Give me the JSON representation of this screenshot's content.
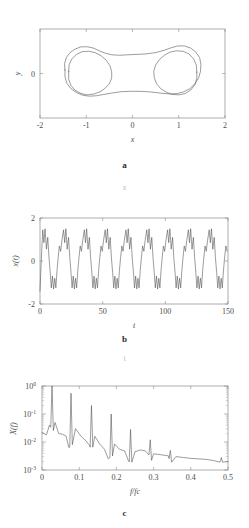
{
  "figure": {
    "caption_a": "a",
    "caption_b": "b",
    "caption_c": "c",
    "ghost_x": "x",
    "ghost_t": "t",
    "curve_color": "#4a4a4a",
    "axis_color": "#8a8a8a"
  },
  "chart_data": [
    {
      "type": "line",
      "panel": "a",
      "title": "",
      "xlabel": "x",
      "ylabel": "y",
      "xlim": [
        -2,
        2
      ],
      "ylim": [
        -1.0,
        1.0
      ],
      "xticks": [
        -2,
        -1,
        0,
        1,
        2
      ],
      "xticklabels": [
        "-2",
        "-1",
        "0",
        "1",
        "2"
      ],
      "yticks": [
        0
      ],
      "yticklabels": [
        "0"
      ],
      "grid": false,
      "legend": "none",
      "description": "Phase portrait: double-well dumbbell shaped attractor with two nested closed orbits",
      "series": [
        {
          "name": "orbit-outer",
          "points": [
            [
              -1.46,
              0.08
            ],
            [
              -1.47,
              0.22
            ],
            [
              -1.43,
              0.36
            ],
            [
              -1.35,
              0.47
            ],
            [
              -1.24,
              0.55
            ],
            [
              -1.11,
              0.6
            ],
            [
              -0.97,
              0.6
            ],
            [
              -0.84,
              0.57
            ],
            [
              -0.72,
              0.51
            ],
            [
              -0.6,
              0.46
            ],
            [
              -0.45,
              0.42
            ],
            [
              -0.28,
              0.41
            ],
            [
              -0.1,
              0.42
            ],
            [
              0.1,
              0.43
            ],
            [
              0.3,
              0.44
            ],
            [
              0.5,
              0.47
            ],
            [
              0.68,
              0.52
            ],
            [
              0.84,
              0.58
            ],
            [
              0.98,
              0.62
            ],
            [
              1.12,
              0.62
            ],
            [
              1.26,
              0.57
            ],
            [
              1.37,
              0.48
            ],
            [
              1.45,
              0.36
            ],
            [
              1.48,
              0.21
            ],
            [
              1.47,
              0.05
            ],
            [
              1.43,
              -0.1
            ],
            [
              1.35,
              -0.23
            ],
            [
              1.24,
              -0.34
            ],
            [
              1.11,
              -0.41
            ],
            [
              0.97,
              -0.45
            ],
            [
              0.83,
              -0.46
            ],
            [
              0.68,
              -0.45
            ],
            [
              0.52,
              -0.43
            ],
            [
              0.34,
              -0.41
            ],
            [
              0.14,
              -0.4
            ],
            [
              -0.06,
              -0.4
            ],
            [
              -0.26,
              -0.41
            ],
            [
              -0.45,
              -0.44
            ],
            [
              -0.62,
              -0.47
            ],
            [
              -0.78,
              -0.5
            ],
            [
              -0.93,
              -0.51
            ],
            [
              -1.07,
              -0.49
            ],
            [
              -1.21,
              -0.43
            ],
            [
              -1.33,
              -0.34
            ],
            [
              -1.42,
              -0.22
            ],
            [
              -1.46,
              -0.07
            ],
            [
              -1.46,
              0.08
            ]
          ]
        },
        {
          "name": "orbit-inner-left",
          "points": [
            [
              -1.38,
              0.05
            ],
            [
              -1.37,
              0.2
            ],
            [
              -1.31,
              0.33
            ],
            [
              -1.21,
              0.43
            ],
            [
              -1.09,
              0.49
            ],
            [
              -0.95,
              0.5
            ],
            [
              -0.81,
              0.47
            ],
            [
              -0.68,
              0.4
            ],
            [
              -0.57,
              0.3
            ],
            [
              -0.49,
              0.18
            ],
            [
              -0.45,
              0.04
            ],
            [
              -0.45,
              -0.1
            ],
            [
              -0.5,
              -0.23
            ],
            [
              -0.59,
              -0.33
            ],
            [
              -0.7,
              -0.41
            ],
            [
              -0.83,
              -0.46
            ],
            [
              -0.97,
              -0.48
            ],
            [
              -1.11,
              -0.45
            ],
            [
              -1.24,
              -0.38
            ],
            [
              -1.33,
              -0.27
            ],
            [
              -1.38,
              -0.13
            ],
            [
              -1.38,
              0.05
            ]
          ]
        },
        {
          "name": "orbit-inner-right",
          "points": [
            [
              1.39,
              0.03
            ],
            [
              1.38,
              0.19
            ],
            [
              1.32,
              0.33
            ],
            [
              1.22,
              0.44
            ],
            [
              1.09,
              0.5
            ],
            [
              0.95,
              0.51
            ],
            [
              0.81,
              0.48
            ],
            [
              0.69,
              0.41
            ],
            [
              0.58,
              0.31
            ],
            [
              0.5,
              0.19
            ],
            [
              0.46,
              0.05
            ],
            [
              0.47,
              -0.09
            ],
            [
              0.52,
              -0.23
            ],
            [
              0.61,
              -0.34
            ],
            [
              0.73,
              -0.42
            ],
            [
              0.86,
              -0.47
            ],
            [
              1.0,
              -0.48
            ],
            [
              1.14,
              -0.45
            ],
            [
              1.26,
              -0.37
            ],
            [
              1.35,
              -0.25
            ],
            [
              1.39,
              -0.11
            ],
            [
              1.39,
              0.03
            ]
          ]
        }
      ]
    },
    {
      "type": "line",
      "panel": "b",
      "title": "",
      "xlabel": "t",
      "ylabel": "x(t)",
      "xlim": [
        0,
        150
      ],
      "ylim": [
        -2,
        2
      ],
      "xticks": [
        0,
        50,
        100,
        150
      ],
      "xticklabels": [
        "0",
        "50",
        "100",
        "150"
      ],
      "yticks": [
        -2,
        0,
        2
      ],
      "yticklabels": [
        "-2",
        "0",
        "2"
      ],
      "grid": false,
      "legend": "none",
      "description": "Time series showing period-doubled oscillation: each cycle has a double peak near +1.5 and a double trough near -1.3, about 9 cycles over t=0..150",
      "waveform": {
        "period": 16.6,
        "n_cycles": 9,
        "upper_peak_1": 1.45,
        "upper_dip": 0.85,
        "upper_peak_2": 1.5,
        "lower_trough_1": -1.25,
        "lower_bump": -0.7,
        "lower_trough_2": -1.3,
        "start_value": -1.4
      }
    },
    {
      "type": "line",
      "panel": "c",
      "title": "",
      "xlabel": "f/fc",
      "ylabel": "X(f)",
      "xlim": [
        0,
        0.5
      ],
      "ylim": [
        0.001,
        1
      ],
      "yscale": "log",
      "xticks": [
        0,
        0.1,
        0.2,
        0.3,
        0.4,
        0.5
      ],
      "xticklabels": [
        "0",
        "0.1",
        "0.2",
        "0.3",
        "0.4",
        "0.5"
      ],
      "yticks": [
        0.001,
        0.01,
        0.1,
        1
      ],
      "yticklabels": [
        "10-3",
        "10-2",
        "10-1",
        "100"
      ],
      "grid": false,
      "legend": "none",
      "description": "Log-scale power spectrum with a fundamental peak near f/fc=0.027 reaching 1.0 and decaying harmonics at multiples, over a decaying broadband floor",
      "peaks": [
        {
          "f": 0.027,
          "amp": 1.0
        },
        {
          "f": 0.078,
          "amp": 0.55
        },
        {
          "f": 0.133,
          "amp": 0.2
        },
        {
          "f": 0.186,
          "amp": 0.1
        },
        {
          "f": 0.238,
          "amp": 0.028
        },
        {
          "f": 0.291,
          "amp": 0.012
        },
        {
          "f": 0.345,
          "amp": 0.005
        },
        {
          "f": 0.482,
          "amp": 0.0028
        }
      ],
      "baseline": [
        [
          0.0,
          0.022
        ],
        [
          0.012,
          0.018
        ],
        [
          0.02,
          0.04
        ],
        [
          0.035,
          0.05
        ],
        [
          0.045,
          0.02
        ],
        [
          0.055,
          0.019
        ],
        [
          0.065,
          0.016
        ],
        [
          0.072,
          0.0065
        ],
        [
          0.09,
          0.03
        ],
        [
          0.105,
          0.016
        ],
        [
          0.118,
          0.011
        ],
        [
          0.128,
          0.0075
        ],
        [
          0.142,
          0.016
        ],
        [
          0.155,
          0.0085
        ],
        [
          0.168,
          0.0055
        ],
        [
          0.178,
          0.0025
        ],
        [
          0.195,
          0.0085
        ],
        [
          0.208,
          0.0055
        ],
        [
          0.222,
          0.0048
        ],
        [
          0.232,
          0.0022
        ],
        [
          0.25,
          0.0045
        ],
        [
          0.265,
          0.0052
        ],
        [
          0.278,
          0.0048
        ],
        [
          0.3,
          0.0038
        ],
        [
          0.32,
          0.0035
        ],
        [
          0.34,
          0.0032
        ],
        [
          0.36,
          0.003
        ],
        [
          0.38,
          0.0028
        ],
        [
          0.4,
          0.0026
        ],
        [
          0.42,
          0.0025
        ],
        [
          0.44,
          0.0024
        ],
        [
          0.46,
          0.0022
        ],
        [
          0.48,
          0.0021
        ],
        [
          0.5,
          0.002
        ]
      ]
    }
  ]
}
